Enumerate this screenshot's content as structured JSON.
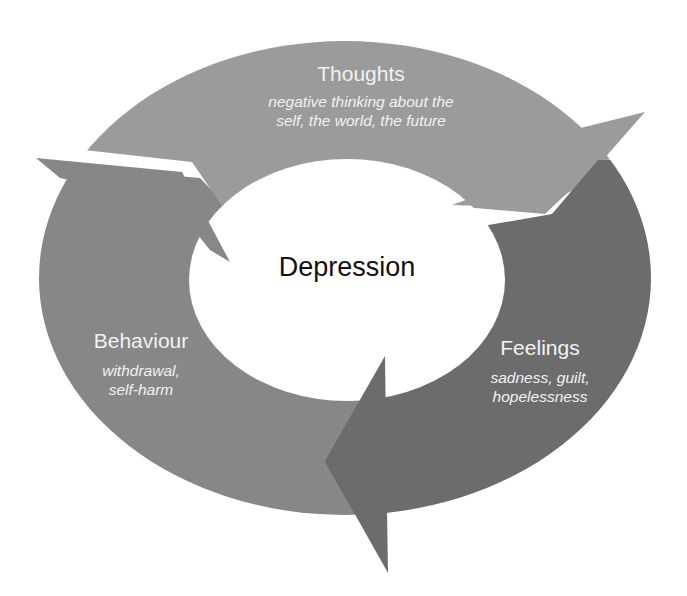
{
  "diagram": {
    "type": "cycle",
    "center": {
      "label": "Depression"
    },
    "segments": [
      {
        "id": "thoughts",
        "title": "Thoughts",
        "description_lines": [
          "negative thinking about the",
          "self, the world, the future"
        ],
        "color": "#9b9b9b",
        "position": "top",
        "arrow_to": "feelings"
      },
      {
        "id": "feelings",
        "title": "Feelings",
        "description_lines": [
          "sadness, guilt,",
          "hopelessness"
        ],
        "color": "#6c6c6c",
        "position": "right",
        "arrow_to": "behaviour"
      },
      {
        "id": "behaviour",
        "title": "Behaviour",
        "description_lines": [
          "withdrawal,",
          "self-harm"
        ],
        "color": "#878787",
        "position": "left",
        "arrow_to": "thoughts"
      }
    ],
    "background": "#ffffff",
    "text_color_on_segments": "#f2f2f2",
    "center_text_color": "#111111"
  }
}
